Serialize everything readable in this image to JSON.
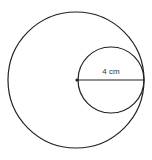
{
  "diagram": {
    "type": "geometry",
    "outer_circle": {
      "cx": 76,
      "cy": 80,
      "r": 68
    },
    "inner_circle": {
      "cx": 111,
      "cy": 80,
      "r": 33
    },
    "diameter_line": {
      "x1": 77,
      "y1": 80,
      "x2": 144,
      "y2": 80
    },
    "center_point": {
      "cx": 77,
      "cy": 80
    },
    "label": "4 cm",
    "stroke_color": "#222222"
  }
}
